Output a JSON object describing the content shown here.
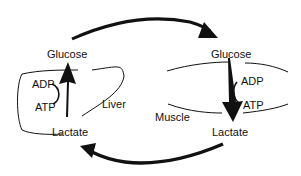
{
  "diagram": {
    "liver": {
      "organ_label": "Liver",
      "top_metabolite": "Glucose",
      "bottom_metabolite": "Lactate",
      "cofactor_top": "ADP",
      "cofactor_bottom": "ATP"
    },
    "muscle": {
      "organ_label": "Muscle",
      "top_metabolite": "Glucose",
      "bottom_metabolite": "Lactate",
      "cofactor_top": "ADP",
      "cofactor_bottom": "ATP"
    },
    "colors": {
      "ink": "#111111",
      "background": "#ffffff"
    }
  }
}
